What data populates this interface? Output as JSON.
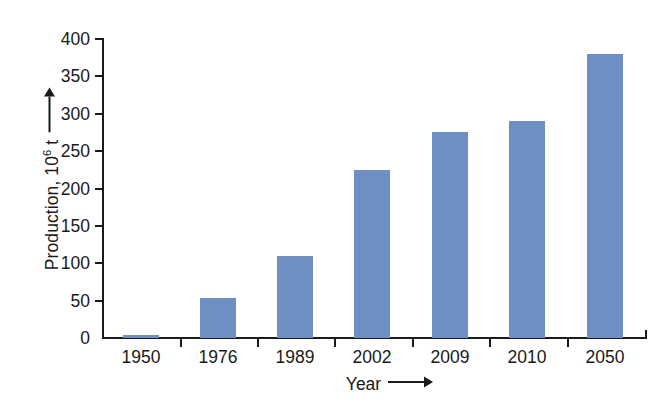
{
  "chart_data": {
    "type": "bar",
    "title": "",
    "categories": [
      "1950",
      "1976",
      "1989",
      "2002",
      "2009",
      "2010",
      "2050"
    ],
    "values": [
      4,
      54,
      110,
      225,
      275,
      290,
      380
    ],
    "xlabel": "Year",
    "ylabel": "Production, 10^6 t",
    "ylim": [
      0,
      400
    ],
    "yticks": [
      0,
      50,
      100,
      150,
      200,
      250,
      300,
      350,
      400
    ],
    "ytick_labels": [
      "0",
      "50",
      "100",
      "150",
      "200",
      "250",
      "300",
      "350",
      "400"
    ],
    "grid": false,
    "legend": false,
    "bar_color": "#6e8fc4",
    "axis_color": "#1a1a1a",
    "background": "#ffffff"
  },
  "axes": {
    "y_title_prefix": "Production, 10",
    "y_title_exponent": "6",
    "y_title_suffix": " t",
    "y_arrow": "↑",
    "x_title": "Year",
    "x_arrow": "⟶"
  }
}
